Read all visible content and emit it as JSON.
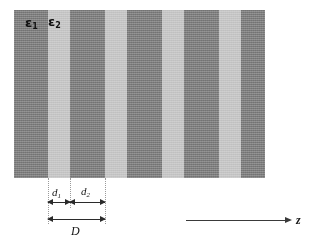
{
  "figure": {
    "type": "periodic-multilayer-diagram",
    "background_color": "#ffffff"
  },
  "materials": [
    {
      "key": "eps1",
      "label": "ε",
      "subscript": "1",
      "color": "#848484",
      "role": "high-index-layer"
    },
    {
      "key": "eps2",
      "label": "ε",
      "subscript": "2",
      "color": "#c8c8c8",
      "role": "low-index-layer"
    }
  ],
  "stripes": [
    {
      "material": "eps1",
      "x": 0,
      "width": 34
    },
    {
      "material": "eps2",
      "x": 34,
      "width": 22
    },
    {
      "material": "eps1",
      "x": 56,
      "width": 35
    },
    {
      "material": "eps2",
      "x": 91,
      "width": 22
    },
    {
      "material": "eps1",
      "x": 113,
      "width": 35
    },
    {
      "material": "eps2",
      "x": 148,
      "width": 22
    },
    {
      "material": "eps1",
      "x": 170,
      "width": 35
    },
    {
      "material": "eps2",
      "x": 205,
      "width": 22
    },
    {
      "material": "eps1",
      "x": 227,
      "width": 24
    }
  ],
  "dimensions": [
    {
      "key": "d1",
      "label": "d",
      "subscript": "1",
      "from_x": 48,
      "to_x": 70,
      "description": "thickness of low-index layer"
    },
    {
      "key": "d2",
      "label": "d",
      "subscript": "2",
      "from_x": 70,
      "to_x": 105,
      "description": "thickness of high-index layer"
    },
    {
      "key": "D",
      "label": "D",
      "subscript": "",
      "from_x": 48,
      "to_x": 105,
      "description": "lattice period"
    }
  ],
  "axis": {
    "label": "z",
    "direction": "right",
    "description": "propagation direction axis"
  },
  "colors": {
    "stripe_dark": "#848484",
    "stripe_light": "#c8c8c8",
    "line": "#2b2b2b",
    "guide": "#9a9a9a",
    "text": "#161616"
  }
}
